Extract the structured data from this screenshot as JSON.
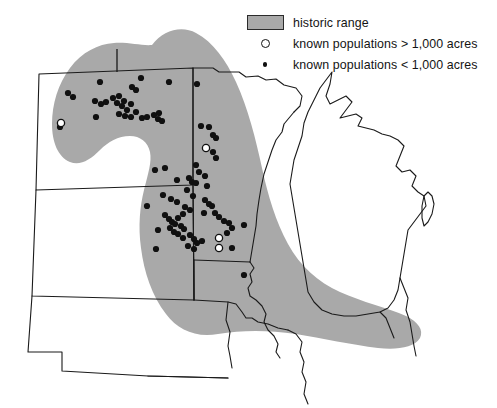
{
  "legend": {
    "items": [
      {
        "symbol": "gray-swatch",
        "label": "historic range"
      },
      {
        "symbol": "open-circle",
        "label": "known populations > 1,000 acres"
      },
      {
        "symbol": "filled-dot",
        "label": "known populations < 1,000 acres"
      }
    ]
  },
  "colors": {
    "historic_range_fill": "#a9a9a9",
    "state_outline": "#1a1a1a",
    "point_fill": "#101010",
    "background": "#ffffff"
  },
  "chart_data": {
    "type": "scatter",
    "title": "historic range",
    "xlabel": "",
    "ylabel": "",
    "projection": "map of north-central United States",
    "regions": [
      {
        "name": "historic range",
        "type": "polygon",
        "fill": "#a9a9a9"
      }
    ],
    "series": [
      {
        "name": "known populations > 1,000 acres",
        "marker": "open-circle",
        "count": 4,
        "points": [
          {
            "x": 61,
            "y": 123
          },
          {
            "x": 206,
            "y": 148
          },
          {
            "x": 219,
            "y": 238
          },
          {
            "x": 219,
            "y": 248
          }
        ]
      },
      {
        "name": "known populations < 1,000 acres",
        "marker": "filled-dot",
        "count": 87,
        "points": [
          {
            "x": 68,
            "y": 93
          },
          {
            "x": 73,
            "y": 97
          },
          {
            "x": 95,
            "y": 101
          },
          {
            "x": 101,
            "y": 104
          },
          {
            "x": 106,
            "y": 102
          },
          {
            "x": 113,
            "y": 98
          },
          {
            "x": 117,
            "y": 103
          },
          {
            "x": 119,
            "y": 96
          },
          {
            "x": 122,
            "y": 106
          },
          {
            "x": 124,
            "y": 101
          },
          {
            "x": 127,
            "y": 110
          },
          {
            "x": 131,
            "y": 104
          },
          {
            "x": 119,
            "y": 114
          },
          {
            "x": 125,
            "y": 116
          },
          {
            "x": 131,
            "y": 117
          },
          {
            "x": 136,
            "y": 112
          },
          {
            "x": 96,
            "y": 117
          },
          {
            "x": 60,
            "y": 127
          },
          {
            "x": 132,
            "y": 87
          },
          {
            "x": 136,
            "y": 90
          },
          {
            "x": 142,
            "y": 118
          },
          {
            "x": 147,
            "y": 117
          },
          {
            "x": 154,
            "y": 115
          },
          {
            "x": 158,
            "y": 119
          },
          {
            "x": 159,
            "y": 113
          },
          {
            "x": 162,
            "y": 121
          },
          {
            "x": 100,
            "y": 82
          },
          {
            "x": 141,
            "y": 78
          },
          {
            "x": 169,
            "y": 82
          },
          {
            "x": 197,
            "y": 84
          },
          {
            "x": 201,
            "y": 126
          },
          {
            "x": 209,
            "y": 127
          },
          {
            "x": 213,
            "y": 135
          },
          {
            "x": 216,
            "y": 138
          },
          {
            "x": 213,
            "y": 152
          },
          {
            "x": 216,
            "y": 158
          },
          {
            "x": 196,
            "y": 165
          },
          {
            "x": 199,
            "y": 172
          },
          {
            "x": 205,
            "y": 176
          },
          {
            "x": 207,
            "y": 186
          },
          {
            "x": 155,
            "y": 170
          },
          {
            "x": 165,
            "y": 168
          },
          {
            "x": 177,
            "y": 180
          },
          {
            "x": 189,
            "y": 178
          },
          {
            "x": 192,
            "y": 182
          },
          {
            "x": 196,
            "y": 183
          },
          {
            "x": 187,
            "y": 190
          },
          {
            "x": 193,
            "y": 196
          },
          {
            "x": 205,
            "y": 200
          },
          {
            "x": 209,
            "y": 204
          },
          {
            "x": 171,
            "y": 199
          },
          {
            "x": 177,
            "y": 202
          },
          {
            "x": 185,
            "y": 207
          },
          {
            "x": 190,
            "y": 210
          },
          {
            "x": 204,
            "y": 213
          },
          {
            "x": 212,
            "y": 206
          },
          {
            "x": 215,
            "y": 213
          },
          {
            "x": 219,
            "y": 217
          },
          {
            "x": 224,
            "y": 221
          },
          {
            "x": 229,
            "y": 223
          },
          {
            "x": 232,
            "y": 228
          },
          {
            "x": 244,
            "y": 225
          },
          {
            "x": 227,
            "y": 233
          },
          {
            "x": 165,
            "y": 215
          },
          {
            "x": 169,
            "y": 219
          },
          {
            "x": 172,
            "y": 222
          },
          {
            "x": 175,
            "y": 224
          },
          {
            "x": 178,
            "y": 218
          },
          {
            "x": 181,
            "y": 226
          },
          {
            "x": 184,
            "y": 229
          },
          {
            "x": 170,
            "y": 228
          },
          {
            "x": 174,
            "y": 232
          },
          {
            "x": 178,
            "y": 234
          },
          {
            "x": 183,
            "y": 238
          },
          {
            "x": 190,
            "y": 235
          },
          {
            "x": 194,
            "y": 239
          },
          {
            "x": 197,
            "y": 243
          },
          {
            "x": 202,
            "y": 241
          },
          {
            "x": 188,
            "y": 246
          },
          {
            "x": 194,
            "y": 249
          },
          {
            "x": 156,
            "y": 249
          },
          {
            "x": 232,
            "y": 248
          },
          {
            "x": 147,
            "y": 206
          },
          {
            "x": 163,
            "y": 195
          },
          {
            "x": 244,
            "y": 275
          },
          {
            "x": 158,
            "y": 230
          },
          {
            "x": 183,
            "y": 214
          }
        ]
      }
    ]
  }
}
